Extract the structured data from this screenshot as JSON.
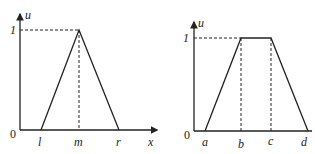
{
  "diagrams": [
    {
      "name": "triangular-membership",
      "y_axis_label": "u",
      "x_axis_label": "x",
      "y_tick_label": "1",
      "origin_label": "0",
      "points": [
        {
          "label": "l",
          "x": 41
        },
        {
          "label": "m",
          "x": 79
        },
        {
          "label": "r",
          "x": 119
        }
      ]
    },
    {
      "name": "trapezoidal-membership",
      "y_axis_label": "u",
      "y_tick_label": "1",
      "origin_label": "0",
      "points": [
        {
          "label": "a",
          "x": 205
        },
        {
          "label": "b",
          "x": 241
        },
        {
          "label": "c",
          "x": 271
        },
        {
          "label": "d",
          "x": 308
        }
      ]
    }
  ],
  "colors": {
    "line": "#222222",
    "background": "#ffffff"
  }
}
